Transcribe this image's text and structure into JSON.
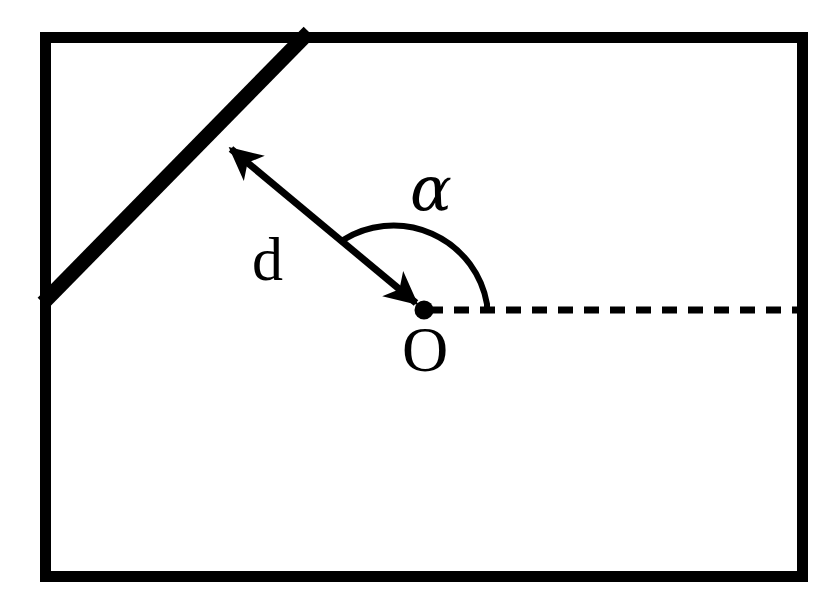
{
  "figure": {
    "title": "",
    "background_color": "#ffffff",
    "ink_color": "#000000"
  },
  "labels": {
    "distance": "d",
    "angle": "α",
    "origin": "O"
  },
  "geometry": {
    "boundary_rect": {
      "x": 40,
      "y": 32,
      "width": 768,
      "height": 550,
      "stroke_width": 11
    },
    "diagonal_wall": {
      "x1": 45,
      "y1": 301,
      "x2": 308,
      "y2": 33,
      "stroke_width": 15
    },
    "origin_point": {
      "x": 424,
      "y": 310,
      "radius": 9
    },
    "distance_arrow": {
      "from_x": 424,
      "from_y": 310,
      "to_x": 223,
      "to_y": 142,
      "stroke_width": 7,
      "double_headed": true
    },
    "dashed_ray": {
      "x1": 424,
      "y1": 310,
      "x2": 808,
      "y2": 310,
      "stroke_width": 7,
      "dash": "15 11"
    },
    "angle_arc": {
      "start_x": 343,
      "start_y": 240,
      "end_x": 487,
      "end_y": 310,
      "stroke_width": 6
    }
  }
}
